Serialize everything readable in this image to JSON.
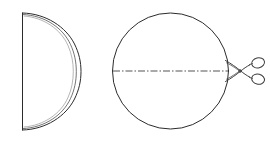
{
  "figure": {
    "background_color": "#ffffff",
    "line_color": "#2b2b2b",
    "cut_line_color": "#555555",
    "width": 270,
    "height": 143
  },
  "left_shape": {
    "name": "folded-half-disc",
    "description": "Half disc (semicircle) with straight vertical fold edge on the left and a doubled curved arc on the right",
    "flat_edge": {
      "x": 22,
      "y_top": 13,
      "y_bottom": 130
    },
    "outer_arc": {
      "rightmost_x": 81,
      "center_y": 71.5,
      "radius_x": 59,
      "radius_y": 58.5
    },
    "inner_arc": {
      "rightmost_x": 76,
      "offset": 5
    }
  },
  "right_shape": {
    "name": "circle-with-cut-line",
    "description": "Full circle with a horizontal dash-dot cut line through its center",
    "circle": {
      "center_x": 170.5,
      "center_y": 71,
      "radius": 58
    },
    "cut_line": {
      "style": "dash-dot",
      "x_start": 113,
      "x_end": 228,
      "y": 71,
      "dash_pattern": "7 2 1.5 2"
    }
  },
  "scissors": {
    "name": "scissors",
    "description": "Open scissors pointing left, blades meeting the cut line at the circle's right edge",
    "pivot_x": 240,
    "pivot_y": 71,
    "blade_tip_x": 226,
    "rings": [
      {
        "cx": 258,
        "cy": 63,
        "rx": 6.5,
        "ry": 5
      },
      {
        "cx": 258,
        "cy": 79,
        "rx": 6.5,
        "ry": 5
      }
    ]
  },
  "labels": {
    "left_figure_label": "",
    "right_figure_label": "",
    "caption": ""
  },
  "chart_data": {
    "type": "diagram",
    "elements": [
      {
        "id": "half-disc",
        "kind": "semicircle",
        "fold_edge": "vertical-left",
        "doubled_arc": true
      },
      {
        "id": "circle",
        "kind": "circle",
        "radius": 58
      },
      {
        "id": "cut-line",
        "kind": "dash-dot-line",
        "orientation": "horizontal",
        "through": "circle-center"
      },
      {
        "id": "scissors",
        "kind": "tool-icon",
        "orientation": "pointing-left"
      }
    ]
  }
}
